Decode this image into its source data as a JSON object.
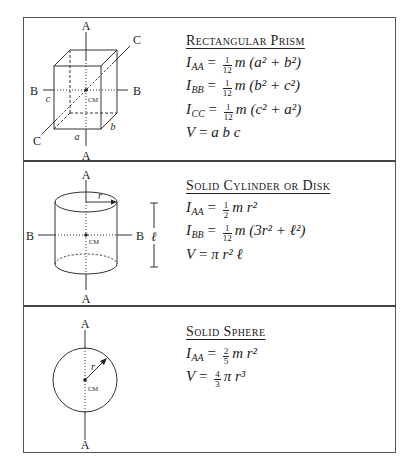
{
  "panels": [
    {
      "heading": "Rectangular Prism",
      "formulas": [
        {
          "lhs": "I",
          "sub": "AA",
          "coef_num": "1",
          "coef_den": "12",
          "body": "m (a² + b²)"
        },
        {
          "lhs": "I",
          "sub": "BB",
          "coef_num": "1",
          "coef_den": "12",
          "body": "m (b² + c²)"
        },
        {
          "lhs": "I",
          "sub": "CC",
          "coef_num": "1",
          "coef_den": "12",
          "body": "m (c² + a²)"
        },
        {
          "lhs": "V",
          "sub": "",
          "coef_num": "",
          "coef_den": "",
          "body": "a b c"
        }
      ],
      "figure": {
        "axis_labels": {
          "a_top": "A",
          "a_bottom": "A",
          "b_left": "B",
          "b_right": "B",
          "c_top": "C",
          "c_bottom": "C"
        },
        "dimension_labels": {
          "a": "a",
          "b": "b",
          "c": "c"
        },
        "center_label": "CM"
      }
    },
    {
      "heading": "Solid Cylinder or Disk",
      "formulas": [
        {
          "lhs": "I",
          "sub": "AA",
          "coef_num": "1",
          "coef_den": "2",
          "body": "m r²"
        },
        {
          "lhs": "I",
          "sub": "BB",
          "coef_num": "1",
          "coef_den": "12",
          "body": "m (3r² + ℓ²)"
        },
        {
          "lhs": "V",
          "sub": "",
          "coef_num": "",
          "coef_den": "",
          "body": "π r² ℓ"
        }
      ],
      "figure": {
        "axis_labels": {
          "a_top": "A",
          "a_bottom": "A",
          "b_left": "B",
          "b_right": "B"
        },
        "dimension_labels": {
          "r": "r",
          "l": "ℓ"
        },
        "center_label": "CM"
      }
    },
    {
      "heading": "Solid Sphere",
      "formulas": [
        {
          "lhs": "I",
          "sub": "AA",
          "coef_num": "2",
          "coef_den": "5",
          "body": "m r²"
        },
        {
          "lhs": "V",
          "sub": "",
          "coef_num": "4",
          "coef_den": "3",
          "body": "π r³"
        }
      ],
      "figure": {
        "axis_labels": {
          "a_top": "A",
          "a_bottom": "A"
        },
        "dimension_labels": {
          "r": "r"
        },
        "center_label": "CM"
      }
    }
  ]
}
